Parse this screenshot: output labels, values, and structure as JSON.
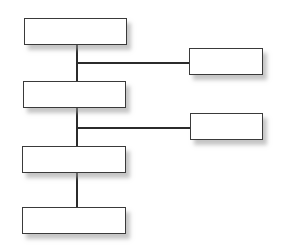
{
  "diagram": {
    "type": "org-chart",
    "line_color": "#2b2b2b",
    "border_color": "#3a3a3a",
    "fill_color": "#ffffff",
    "shadow_color": "#969696",
    "nodes": [
      {
        "id": "main-1",
        "label": "",
        "x": 24,
        "y": 18,
        "w": 103,
        "h": 27
      },
      {
        "id": "main-2",
        "label": "",
        "x": 23,
        "y": 81,
        "w": 103,
        "h": 27
      },
      {
        "id": "main-3",
        "label": "",
        "x": 22,
        "y": 146,
        "w": 104,
        "h": 27
      },
      {
        "id": "main-4",
        "label": "",
        "x": 22,
        "y": 207,
        "w": 104,
        "h": 27
      },
      {
        "id": "side-1",
        "label": "",
        "x": 189,
        "y": 48,
        "w": 74,
        "h": 27
      },
      {
        "id": "side-2",
        "label": "",
        "x": 190,
        "y": 113,
        "w": 73,
        "h": 27
      }
    ],
    "connectors": [
      {
        "id": "trunk-1-2",
        "orientation": "vertical",
        "x": 77,
        "y": 45,
        "length": 36
      },
      {
        "id": "trunk-2-3",
        "orientation": "vertical",
        "x": 77,
        "y": 108,
        "length": 38
      },
      {
        "id": "trunk-3-4",
        "orientation": "vertical",
        "x": 77,
        "y": 173,
        "length": 34
      },
      {
        "id": "branch-side-1",
        "orientation": "horizontal",
        "x": 77,
        "y": 62,
        "length": 112
      },
      {
        "id": "branch-side-2",
        "orientation": "horizontal",
        "x": 77,
        "y": 127,
        "length": 113
      }
    ]
  }
}
